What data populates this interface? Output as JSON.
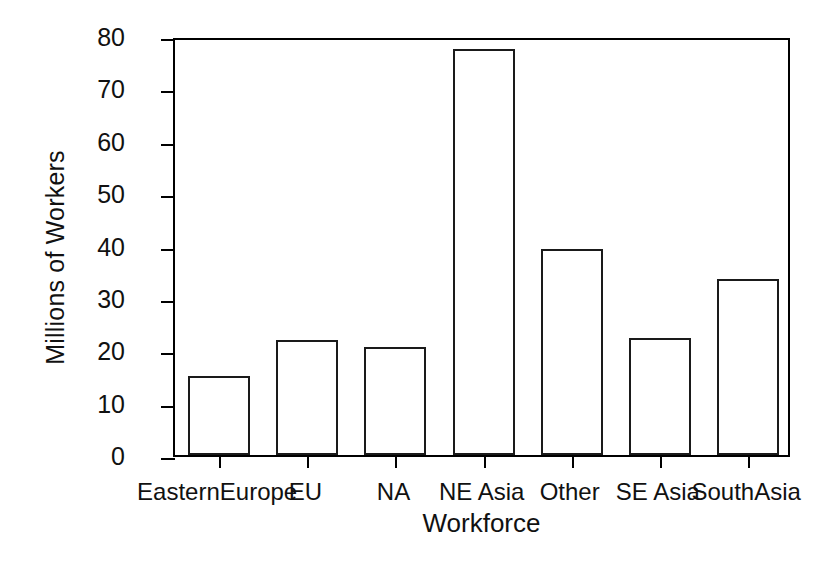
{
  "chart_data": {
    "type": "bar",
    "title": "",
    "xlabel": "Workforce",
    "ylabel": "Millions of Workers",
    "categories": [
      "EasternEurope",
      "EU",
      "NA",
      "NE Asia",
      "Other",
      "SE Asia",
      "SouthAsia"
    ],
    "values": [
      15.0,
      22.0,
      20.7,
      77.5,
      39.4,
      22.3,
      33.7
    ],
    "ylim": [
      0,
      80
    ],
    "yticks": [
      0,
      10,
      20,
      30,
      40,
      50,
      60,
      70,
      80
    ],
    "ytick_labels": [
      "0",
      "10",
      "20",
      "30",
      "40",
      "50",
      "60",
      "70",
      "80"
    ],
    "grid": false,
    "legend": "none",
    "bar_fill": "#ffffff",
    "bar_edge": "#1a1a1a",
    "axis_color": "#000000"
  }
}
